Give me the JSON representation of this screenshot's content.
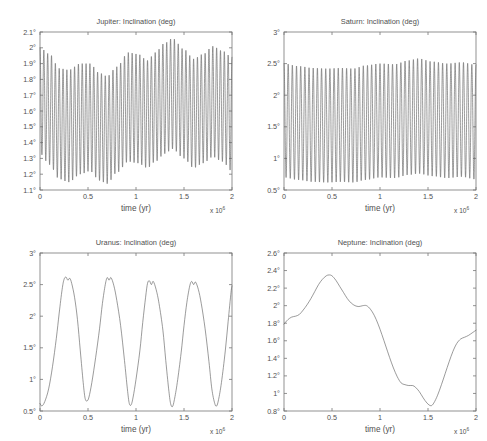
{
  "figure": {
    "background": "#ffffff",
    "line_color": "#5c5c5c",
    "axis_color": "#777777",
    "width": 487,
    "height": 441
  },
  "panels": [
    {
      "key": "jupiter",
      "title": "Jupiter: Inclination (deg)",
      "xlabel": "time (yr)",
      "exponent_base": "x 10",
      "exponent_power": "6",
      "xticks": [
        "0",
        "0.5",
        "1",
        "1.5",
        "2"
      ],
      "yticks": [
        "1.1°",
        "1.2°",
        "1.3°",
        "1.4°",
        "1.5°",
        "1.6°",
        "1.7°",
        "1.8°",
        "1.9°",
        "2°",
        "2.1°"
      ]
    },
    {
      "key": "saturn",
      "title": "Saturn: Inclination (deg)",
      "xlabel": "time (yr)",
      "exponent_base": "x 10",
      "exponent_power": "6",
      "xticks": [
        "0",
        "0.5",
        "1",
        "1.5",
        "2"
      ],
      "yticks": [
        "0.5°",
        "1°",
        "1.5°",
        "2°",
        "2.5°",
        "3°"
      ]
    },
    {
      "key": "uranus",
      "title": "Uranus: Inclination (deg)",
      "xlabel": "time (yr)",
      "exponent_base": "x 10",
      "exponent_power": "6",
      "xticks": [
        "0",
        "0.5",
        "1",
        "1.5",
        "2"
      ],
      "yticks": [
        "0.5°",
        "1°",
        "1.5°",
        "2°",
        "2.5°",
        "3°"
      ]
    },
    {
      "key": "neptune",
      "title": "Neptune: Inclination (deg)",
      "xlabel": "time (yr)",
      "exponent_base": "x 10",
      "exponent_power": "6",
      "xticks": [
        "0",
        "0.5",
        "1",
        "1.5",
        "2"
      ],
      "yticks": [
        "0.8°",
        "1°",
        "1.2°",
        "1.4°",
        "1.6°",
        "1.8°",
        "2°",
        "2.2°",
        "2.4°",
        "2.6°"
      ]
    }
  ],
  "chart_data": [
    {
      "type": "line",
      "key": "jupiter",
      "title": "Jupiter: Inclination (deg)",
      "xlabel": "time (yr)",
      "ylabel": "",
      "x_exponent": 1000000,
      "xlim": [
        0,
        2000000
      ],
      "ylim": [
        1.1,
        2.1
      ],
      "xticks": [
        0,
        500000,
        1000000,
        1500000,
        2000000
      ],
      "yticks": [
        1.1,
        1.2,
        1.3,
        1.4,
        1.5,
        1.6,
        1.7,
        1.8,
        1.9,
        2.0,
        2.1
      ],
      "grid": false,
      "legend": "none",
      "description": "Rapid oscillation, approx 50 cycles over 2e6 yr (period approx 40000 yr), with a slowly varying amplitude envelope.",
      "oscillation": {
        "cycles": 50,
        "center_mean": 1.6,
        "envelope_upper_nodes": [
          {
            "x": 0.0,
            "y": 2.0
          },
          {
            "x": 0.1,
            "y": 1.96
          },
          {
            "x": 0.2,
            "y": 1.87
          },
          {
            "x": 0.3,
            "y": 1.86
          },
          {
            "x": 0.42,
            "y": 1.9
          },
          {
            "x": 0.52,
            "y": 1.9
          },
          {
            "x": 0.62,
            "y": 1.84
          },
          {
            "x": 0.7,
            "y": 1.82
          },
          {
            "x": 0.8,
            "y": 1.88
          },
          {
            "x": 0.92,
            "y": 1.97
          },
          {
            "x": 1.02,
            "y": 1.96
          },
          {
            "x": 1.12,
            "y": 1.92
          },
          {
            "x": 1.2,
            "y": 1.97
          },
          {
            "x": 1.3,
            "y": 2.03
          },
          {
            "x": 1.38,
            "y": 2.06
          },
          {
            "x": 1.5,
            "y": 1.99
          },
          {
            "x": 1.6,
            "y": 1.93
          },
          {
            "x": 1.7,
            "y": 1.96
          },
          {
            "x": 1.8,
            "y": 2.01
          },
          {
            "x": 1.9,
            "y": 1.98
          },
          {
            "x": 2.0,
            "y": 1.94
          }
        ],
        "envelope_lower_nodes": [
          {
            "x": 0.0,
            "y": 1.33
          },
          {
            "x": 0.1,
            "y": 1.26
          },
          {
            "x": 0.2,
            "y": 1.17
          },
          {
            "x": 0.3,
            "y": 1.15
          },
          {
            "x": 0.42,
            "y": 1.2
          },
          {
            "x": 0.52,
            "y": 1.22
          },
          {
            "x": 0.62,
            "y": 1.16
          },
          {
            "x": 0.7,
            "y": 1.14
          },
          {
            "x": 0.8,
            "y": 1.21
          },
          {
            "x": 0.92,
            "y": 1.28
          },
          {
            "x": 1.02,
            "y": 1.27
          },
          {
            "x": 1.12,
            "y": 1.24
          },
          {
            "x": 1.2,
            "y": 1.28
          },
          {
            "x": 1.3,
            "y": 1.33
          },
          {
            "x": 1.38,
            "y": 1.36
          },
          {
            "x": 1.5,
            "y": 1.3
          },
          {
            "x": 1.6,
            "y": 1.24
          },
          {
            "x": 1.7,
            "y": 1.27
          },
          {
            "x": 1.8,
            "y": 1.31
          },
          {
            "x": 1.9,
            "y": 1.28
          },
          {
            "x": 2.0,
            "y": 1.22
          }
        ]
      }
    },
    {
      "type": "line",
      "key": "saturn",
      "title": "Saturn: Inclination (deg)",
      "xlabel": "time (yr)",
      "ylabel": "",
      "x_exponent": 1000000,
      "xlim": [
        0,
        2000000
      ],
      "ylim": [
        0.5,
        3.0
      ],
      "xticks": [
        0,
        500000,
        1000000,
        1500000,
        2000000
      ],
      "yticks": [
        0.5,
        1.0,
        1.5,
        2.0,
        2.5,
        3.0
      ],
      "grid": false,
      "legend": "none",
      "description": "Rapid oscillation, approx 46 cycles over 2e6 yr, amplitude nearly constant between about 0.65 and 2.55 degrees.",
      "oscillation": {
        "cycles": 46,
        "center_mean": 1.6,
        "envelope_upper_nodes": [
          {
            "x": 0.0,
            "y": 2.5
          },
          {
            "x": 0.15,
            "y": 2.46
          },
          {
            "x": 0.3,
            "y": 2.43
          },
          {
            "x": 0.45,
            "y": 2.42
          },
          {
            "x": 0.6,
            "y": 2.43
          },
          {
            "x": 0.72,
            "y": 2.42
          },
          {
            "x": 0.85,
            "y": 2.47
          },
          {
            "x": 1.0,
            "y": 2.5
          },
          {
            "x": 1.15,
            "y": 2.49
          },
          {
            "x": 1.3,
            "y": 2.55
          },
          {
            "x": 1.4,
            "y": 2.58
          },
          {
            "x": 1.55,
            "y": 2.53
          },
          {
            "x": 1.7,
            "y": 2.5
          },
          {
            "x": 1.85,
            "y": 2.52
          },
          {
            "x": 2.0,
            "y": 2.48
          }
        ],
        "envelope_lower_nodes": [
          {
            "x": 0.0,
            "y": 0.7
          },
          {
            "x": 0.15,
            "y": 0.66
          },
          {
            "x": 0.3,
            "y": 0.63
          },
          {
            "x": 0.45,
            "y": 0.62
          },
          {
            "x": 0.6,
            "y": 0.63
          },
          {
            "x": 0.72,
            "y": 0.62
          },
          {
            "x": 0.85,
            "y": 0.66
          },
          {
            "x": 1.0,
            "y": 0.7
          },
          {
            "x": 1.15,
            "y": 0.69
          },
          {
            "x": 1.3,
            "y": 0.74
          },
          {
            "x": 1.4,
            "y": 0.76
          },
          {
            "x": 1.55,
            "y": 0.72
          },
          {
            "x": 1.7,
            "y": 0.69
          },
          {
            "x": 1.85,
            "y": 0.71
          },
          {
            "x": 2.0,
            "y": 0.67
          }
        ]
      }
    },
    {
      "type": "line",
      "key": "uranus",
      "title": "Uranus: Inclination (deg)",
      "xlabel": "time (yr)",
      "ylabel": "",
      "x_exponent": 1000000,
      "xlim": [
        0,
        2000000
      ],
      "ylim": [
        0.5,
        3.0
      ],
      "xticks": [
        0,
        500000,
        1000000,
        1500000,
        2000000
      ],
      "yticks": [
        0.5,
        1.0,
        1.5,
        2.0,
        2.5,
        3.0
      ],
      "grid": false,
      "legend": "none",
      "description": "Smooth large-amplitude oscillation with period about 0.45e6 yr; rounded flat-topped maxima near 2.6 deg with a small dip at the crest, sharp minima near 0.55 deg.",
      "points": [
        {
          "x": 0.0,
          "y": 0.62
        },
        {
          "x": 0.02,
          "y": 0.58
        },
        {
          "x": 0.05,
          "y": 0.65
        },
        {
          "x": 0.09,
          "y": 0.85
        },
        {
          "x": 0.13,
          "y": 1.2
        },
        {
          "x": 0.17,
          "y": 1.65
        },
        {
          "x": 0.2,
          "y": 2.05
        },
        {
          "x": 0.23,
          "y": 2.42
        },
        {
          "x": 0.25,
          "y": 2.58
        },
        {
          "x": 0.27,
          "y": 2.62
        },
        {
          "x": 0.29,
          "y": 2.57
        },
        {
          "x": 0.31,
          "y": 2.6
        },
        {
          "x": 0.33,
          "y": 2.52
        },
        {
          "x": 0.36,
          "y": 2.3
        },
        {
          "x": 0.39,
          "y": 1.95
        },
        {
          "x": 0.42,
          "y": 1.45
        },
        {
          "x": 0.45,
          "y": 0.95
        },
        {
          "x": 0.47,
          "y": 0.7
        },
        {
          "x": 0.49,
          "y": 0.66
        },
        {
          "x": 0.51,
          "y": 0.72
        },
        {
          "x": 0.54,
          "y": 0.95
        },
        {
          "x": 0.58,
          "y": 1.35
        },
        {
          "x": 0.62,
          "y": 1.8
        },
        {
          "x": 0.65,
          "y": 2.2
        },
        {
          "x": 0.68,
          "y": 2.5
        },
        {
          "x": 0.7,
          "y": 2.61
        },
        {
          "x": 0.72,
          "y": 2.57
        },
        {
          "x": 0.74,
          "y": 2.61
        },
        {
          "x": 0.77,
          "y": 2.48
        },
        {
          "x": 0.8,
          "y": 2.25
        },
        {
          "x": 0.84,
          "y": 1.85
        },
        {
          "x": 0.88,
          "y": 1.3
        },
        {
          "x": 0.91,
          "y": 0.85
        },
        {
          "x": 0.93,
          "y": 0.62
        },
        {
          "x": 0.95,
          "y": 0.6
        },
        {
          "x": 0.97,
          "y": 0.72
        },
        {
          "x": 1.0,
          "y": 1.0
        },
        {
          "x": 1.04,
          "y": 1.45
        },
        {
          "x": 1.07,
          "y": 1.9
        },
        {
          "x": 1.1,
          "y": 2.3
        },
        {
          "x": 1.12,
          "y": 2.52
        },
        {
          "x": 1.14,
          "y": 2.56
        },
        {
          "x": 1.16,
          "y": 2.5
        },
        {
          "x": 1.18,
          "y": 2.55
        },
        {
          "x": 1.21,
          "y": 2.42
        },
        {
          "x": 1.24,
          "y": 2.2
        },
        {
          "x": 1.28,
          "y": 1.78
        },
        {
          "x": 1.31,
          "y": 1.3
        },
        {
          "x": 1.34,
          "y": 0.85
        },
        {
          "x": 1.36,
          "y": 0.62
        },
        {
          "x": 1.38,
          "y": 0.57
        },
        {
          "x": 1.4,
          "y": 0.68
        },
        {
          "x": 1.43,
          "y": 0.95
        },
        {
          "x": 1.47,
          "y": 1.42
        },
        {
          "x": 1.5,
          "y": 1.85
        },
        {
          "x": 1.53,
          "y": 2.22
        },
        {
          "x": 1.56,
          "y": 2.48
        },
        {
          "x": 1.58,
          "y": 2.55
        },
        {
          "x": 1.6,
          "y": 2.5
        },
        {
          "x": 1.62,
          "y": 2.54
        },
        {
          "x": 1.65,
          "y": 2.42
        },
        {
          "x": 1.68,
          "y": 2.2
        },
        {
          "x": 1.72,
          "y": 1.8
        },
        {
          "x": 1.76,
          "y": 1.28
        },
        {
          "x": 1.79,
          "y": 0.85
        },
        {
          "x": 1.82,
          "y": 0.62
        },
        {
          "x": 1.84,
          "y": 0.58
        },
        {
          "x": 1.86,
          "y": 0.68
        },
        {
          "x": 1.89,
          "y": 0.95
        },
        {
          "x": 1.93,
          "y": 1.45
        },
        {
          "x": 1.96,
          "y": 1.92
        },
        {
          "x": 1.99,
          "y": 2.38
        },
        {
          "x": 2.0,
          "y": 2.48
        }
      ]
    },
    {
      "type": "line",
      "key": "neptune",
      "title": "Neptune: Inclination (deg)",
      "xlabel": "time (yr)",
      "ylabel": "",
      "x_exponent": 1000000,
      "xlim": [
        0,
        2000000
      ],
      "ylim": [
        0.8,
        2.6
      ],
      "xticks": [
        0,
        500000,
        1000000,
        1500000,
        2000000
      ],
      "yticks": [
        0.8,
        1.0,
        1.2,
        1.4,
        1.6,
        1.8,
        2.0,
        2.2,
        2.4,
        2.6
      ],
      "grid": false,
      "legend": "none",
      "description": "Single slow smooth excursion: starts near 1.8 deg, rises to a maximum of about 2.35 deg at t=0.47e6 yr, a shoulder near 2.0 deg at t=0.85e6, falls to a ledge near 1.1 deg at t=1.25e6, reaches a minimum of about 0.85 deg at t=1.53e6, then rises to about 1.72 deg at t=2e6.",
      "points": [
        {
          "x": 0.0,
          "y": 1.79
        },
        {
          "x": 0.04,
          "y": 1.84
        },
        {
          "x": 0.08,
          "y": 1.87
        },
        {
          "x": 0.12,
          "y": 1.88
        },
        {
          "x": 0.16,
          "y": 1.9
        },
        {
          "x": 0.2,
          "y": 1.95
        },
        {
          "x": 0.24,
          "y": 2.01
        },
        {
          "x": 0.28,
          "y": 2.08
        },
        {
          "x": 0.32,
          "y": 2.16
        },
        {
          "x": 0.36,
          "y": 2.24
        },
        {
          "x": 0.4,
          "y": 2.3
        },
        {
          "x": 0.44,
          "y": 2.34
        },
        {
          "x": 0.47,
          "y": 2.35
        },
        {
          "x": 0.5,
          "y": 2.34
        },
        {
          "x": 0.54,
          "y": 2.29
        },
        {
          "x": 0.58,
          "y": 2.22
        },
        {
          "x": 0.62,
          "y": 2.15
        },
        {
          "x": 0.66,
          "y": 2.08
        },
        {
          "x": 0.7,
          "y": 2.03
        },
        {
          "x": 0.74,
          "y": 2.0
        },
        {
          "x": 0.78,
          "y": 1.99
        },
        {
          "x": 0.82,
          "y": 2.0
        },
        {
          "x": 0.86,
          "y": 2.0
        },
        {
          "x": 0.9,
          "y": 1.96
        },
        {
          "x": 0.94,
          "y": 1.89
        },
        {
          "x": 0.98,
          "y": 1.79
        },
        {
          "x": 1.02,
          "y": 1.67
        },
        {
          "x": 1.06,
          "y": 1.54
        },
        {
          "x": 1.1,
          "y": 1.41
        },
        {
          "x": 1.14,
          "y": 1.29
        },
        {
          "x": 1.18,
          "y": 1.19
        },
        {
          "x": 1.22,
          "y": 1.12
        },
        {
          "x": 1.26,
          "y": 1.1
        },
        {
          "x": 1.3,
          "y": 1.09
        },
        {
          "x": 1.34,
          "y": 1.09
        },
        {
          "x": 1.37,
          "y": 1.07
        },
        {
          "x": 1.41,
          "y": 1.02
        },
        {
          "x": 1.45,
          "y": 0.95
        },
        {
          "x": 1.49,
          "y": 0.89
        },
        {
          "x": 1.53,
          "y": 0.86
        },
        {
          "x": 1.56,
          "y": 0.89
        },
        {
          "x": 1.6,
          "y": 0.98
        },
        {
          "x": 1.64,
          "y": 1.1
        },
        {
          "x": 1.68,
          "y": 1.23
        },
        {
          "x": 1.72,
          "y": 1.36
        },
        {
          "x": 1.76,
          "y": 1.48
        },
        {
          "x": 1.8,
          "y": 1.57
        },
        {
          "x": 1.84,
          "y": 1.62
        },
        {
          "x": 1.88,
          "y": 1.64
        },
        {
          "x": 1.92,
          "y": 1.66
        },
        {
          "x": 1.96,
          "y": 1.69
        },
        {
          "x": 2.0,
          "y": 1.72
        }
      ]
    }
  ]
}
